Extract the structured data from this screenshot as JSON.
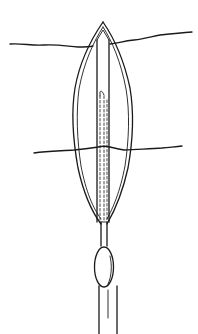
{
  "figure": {
    "type": "line-illustration",
    "colors": {
      "ink": "#1a1a1a",
      "background": "#ffffff"
    },
    "elements": [
      {
        "name": "upper-suture",
        "description": "wavy horizontal suture line crossing near top of incision"
      },
      {
        "name": "lower-suture",
        "description": "wavy horizontal suture line crossing lower part of incision"
      },
      {
        "name": "incision-outline",
        "description": "leaf/lens-shaped double outline with pointed apex"
      },
      {
        "name": "drain-tube",
        "description": "central tube with dashed inner lumen lines"
      },
      {
        "name": "bulb",
        "description": "oval bulb on the tube below the incision"
      },
      {
        "name": "outer-tube",
        "description": "wider tube continuing to the bottom edge"
      }
    ]
  }
}
